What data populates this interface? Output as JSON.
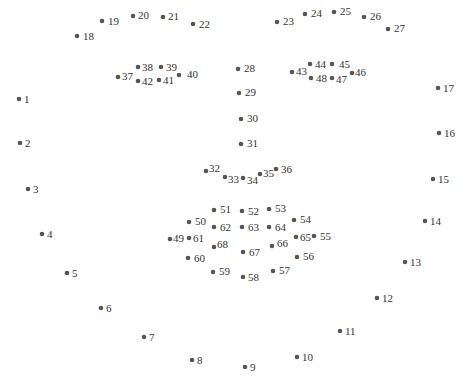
{
  "diagram": {
    "type": "68-point facial landmark map",
    "dot_color": "#555555",
    "label_color": "#333333",
    "background": "#ffffff",
    "groups": [
      {
        "name": "jaw",
        "range": [
          1,
          17
        ]
      },
      {
        "name": "right-eyebrow",
        "range": [
          18,
          22
        ]
      },
      {
        "name": "left-eyebrow",
        "range": [
          23,
          27
        ]
      },
      {
        "name": "nose-bridge",
        "range": [
          28,
          31
        ]
      },
      {
        "name": "nose-bottom",
        "range": [
          32,
          36
        ]
      },
      {
        "name": "right-eye",
        "range": [
          37,
          42
        ]
      },
      {
        "name": "left-eye",
        "range": [
          43,
          48
        ]
      },
      {
        "name": "outer-lip",
        "range": [
          49,
          60
        ]
      },
      {
        "name": "inner-lip",
        "range": [
          61,
          68
        ]
      }
    ],
    "points": [
      {
        "id": "1",
        "x": 19,
        "y": 99,
        "lx": 5,
        "ly": 4
      },
      {
        "id": "2",
        "x": 20,
        "y": 143,
        "lx": 5,
        "ly": 4
      },
      {
        "id": "3",
        "x": 28,
        "y": 189,
        "lx": 5,
        "ly": 4
      },
      {
        "id": "4",
        "x": 42,
        "y": 234,
        "lx": 5,
        "ly": 4
      },
      {
        "id": "5",
        "x": 67,
        "y": 273,
        "lx": 5,
        "ly": 4
      },
      {
        "id": "6",
        "x": 101,
        "y": 308,
        "lx": 5,
        "ly": 4
      },
      {
        "id": "7",
        "x": 144,
        "y": 337,
        "lx": 5,
        "ly": 4
      },
      {
        "id": "8",
        "x": 192,
        "y": 360,
        "lx": 5,
        "ly": 4
      },
      {
        "id": "9",
        "x": 245,
        "y": 367,
        "lx": 5,
        "ly": 4
      },
      {
        "id": "10",
        "x": 297,
        "y": 357,
        "lx": 5,
        "ly": 4
      },
      {
        "id": "11",
        "x": 340,
        "y": 331,
        "lx": 5,
        "ly": 4
      },
      {
        "id": "12",
        "x": 377,
        "y": 298,
        "lx": 5,
        "ly": 4
      },
      {
        "id": "13",
        "x": 405,
        "y": 262,
        "lx": 5,
        "ly": 4
      },
      {
        "id": "14",
        "x": 425,
        "y": 221,
        "lx": 5,
        "ly": 4
      },
      {
        "id": "15",
        "x": 433,
        "y": 179,
        "lx": 5,
        "ly": 4
      },
      {
        "id": "16",
        "x": 439,
        "y": 133,
        "lx": 5,
        "ly": 4
      },
      {
        "id": "17",
        "x": 438,
        "y": 88,
        "lx": 5,
        "ly": 4
      },
      {
        "id": "18",
        "x": 77,
        "y": 36,
        "lx": 6,
        "ly": 4
      },
      {
        "id": "19",
        "x": 102,
        "y": 21,
        "lx": 6,
        "ly": 4
      },
      {
        "id": "20",
        "x": 133,
        "y": 16,
        "lx": 5,
        "ly": 3
      },
      {
        "id": "21",
        "x": 163,
        "y": 17,
        "lx": 5,
        "ly": 3
      },
      {
        "id": "22",
        "x": 193,
        "y": 24,
        "lx": 6,
        "ly": 4
      },
      {
        "id": "23",
        "x": 277,
        "y": 22,
        "lx": 6,
        "ly": 3
      },
      {
        "id": "24",
        "x": 305,
        "y": 14,
        "lx": 6,
        "ly": 3
      },
      {
        "id": "25",
        "x": 334,
        "y": 12,
        "lx": 6,
        "ly": 3
      },
      {
        "id": "26",
        "x": 364,
        "y": 17,
        "lx": 6,
        "ly": 3
      },
      {
        "id": "27",
        "x": 388,
        "y": 29,
        "lx": 6,
        "ly": 3
      },
      {
        "id": "28",
        "x": 238,
        "y": 69,
        "lx": 6,
        "ly": 3
      },
      {
        "id": "29",
        "x": 239,
        "y": 93,
        "lx": 6,
        "ly": 3
      },
      {
        "id": "30",
        "x": 241,
        "y": 119,
        "lx": 6,
        "ly": 3
      },
      {
        "id": "31",
        "x": 241,
        "y": 144,
        "lx": 6,
        "ly": 3
      },
      {
        "id": "32",
        "x": 206,
        "y": 171,
        "lx": 3,
        "ly": 1
      },
      {
        "id": "33",
        "x": 225,
        "y": 177,
        "lx": 3,
        "ly": 6
      },
      {
        "id": "34",
        "x": 243,
        "y": 178,
        "lx": 4,
        "ly": 6
      },
      {
        "id": "35",
        "x": 260,
        "y": 174,
        "lx": 3,
        "ly": 3
      },
      {
        "id": "36",
        "x": 276,
        "y": 169,
        "lx": 5,
        "ly": 4
      },
      {
        "id": "37",
        "x": 118,
        "y": 77,
        "lx": 4,
        "ly": 3
      },
      {
        "id": "38",
        "x": 138,
        "y": 67,
        "lx": 4,
        "ly": 4
      },
      {
        "id": "39",
        "x": 161,
        "y": 67,
        "lx": 5,
        "ly": 4
      },
      {
        "id": "40",
        "x": 179,
        "y": 75,
        "lx": 8,
        "ly": 3
      },
      {
        "id": "41",
        "x": 159,
        "y": 80,
        "lx": 4,
        "ly": 4
      },
      {
        "id": "42",
        "x": 138,
        "y": 81,
        "lx": 4,
        "ly": 4
      },
      {
        "id": "43",
        "x": 292,
        "y": 72,
        "lx": 4,
        "ly": 3
      },
      {
        "id": "44",
        "x": 310,
        "y": 64,
        "lx": 5,
        "ly": 4
      },
      {
        "id": "45",
        "x": 332,
        "y": 64,
        "lx": 7,
        "ly": 4
      },
      {
        "id": "46",
        "x": 352,
        "y": 73,
        "lx": 3,
        "ly": 3
      },
      {
        "id": "47",
        "x": 332,
        "y": 78,
        "lx": 4,
        "ly": 5
      },
      {
        "id": "48",
        "x": 311,
        "y": 78,
        "lx": 5,
        "ly": 4
      },
      {
        "id": "49",
        "x": 170,
        "y": 239,
        "lx": 3,
        "ly": 3
      },
      {
        "id": "50",
        "x": 189,
        "y": 222,
        "lx": 6,
        "ly": 3
      },
      {
        "id": "51",
        "x": 214,
        "y": 210,
        "lx": 6,
        "ly": 3
      },
      {
        "id": "52",
        "x": 242,
        "y": 211,
        "lx": 6,
        "ly": 4
      },
      {
        "id": "53",
        "x": 269,
        "y": 209,
        "lx": 6,
        "ly": 3
      },
      {
        "id": "54",
        "x": 294,
        "y": 220,
        "lx": 6,
        "ly": 3
      },
      {
        "id": "55",
        "x": 314,
        "y": 236,
        "lx": 6,
        "ly": 4
      },
      {
        "id": "56",
        "x": 297,
        "y": 257,
        "lx": 6,
        "ly": 3
      },
      {
        "id": "57",
        "x": 273,
        "y": 271,
        "lx": 6,
        "ly": 3
      },
      {
        "id": "58",
        "x": 243,
        "y": 277,
        "lx": 5,
        "ly": 4
      },
      {
        "id": "59",
        "x": 213,
        "y": 272,
        "lx": 6,
        "ly": 3
      },
      {
        "id": "60",
        "x": 188,
        "y": 258,
        "lx": 6,
        "ly": 4
      },
      {
        "id": "61",
        "x": 189,
        "y": 238,
        "lx": 4,
        "ly": 4
      },
      {
        "id": "62",
        "x": 214,
        "y": 227,
        "lx": 6,
        "ly": 4
      },
      {
        "id": "63",
        "x": 242,
        "y": 227,
        "lx": 6,
        "ly": 4
      },
      {
        "id": "64",
        "x": 269,
        "y": 227,
        "lx": 6,
        "ly": 4
      },
      {
        "id": "65",
        "x": 296,
        "y": 237,
        "lx": 4,
        "ly": 4
      },
      {
        "id": "66",
        "x": 272,
        "y": 246,
        "lx": 5,
        "ly": 1
      },
      {
        "id": "67",
        "x": 243,
        "y": 252,
        "lx": 6,
        "ly": 4
      },
      {
        "id": "68",
        "x": 214,
        "y": 247,
        "lx": 3,
        "ly": 1
      }
    ]
  }
}
